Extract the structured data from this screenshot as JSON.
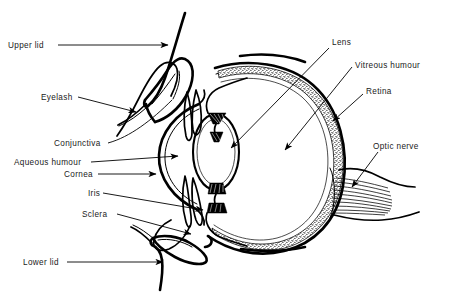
{
  "figure": {
    "background_color": "#ffffff",
    "ink_color": "#000000",
    "width": 451,
    "height": 302
  },
  "labels": {
    "upper_lid": "Upper lid",
    "eyelash": "Eyelash",
    "conjunctiva": "Conjunctiva",
    "aqueous_humour": "Aqueous humour",
    "cornea": "Cornea",
    "iris": "Iris",
    "sclera": "Sclera",
    "lower_lid": "Lower lid",
    "lens": "Lens",
    "vitreous_humour": "Vitreous humour",
    "retina": "Retina",
    "optic_nerve": "Optic nerve"
  },
  "parts": [
    {
      "id": "upper-lid",
      "label": "Upper lid",
      "side": "left",
      "label_x": 8,
      "label_y": 48,
      "leader_end_x": 168,
      "leader_end_y": 47
    },
    {
      "id": "eyelash",
      "label": "Eyelash",
      "side": "left",
      "label_x": 41,
      "label_y": 100,
      "leader_end_x": 135,
      "leader_end_y": 111
    },
    {
      "id": "conjunctiva",
      "label": "Conjunctiva",
      "side": "left",
      "label_x": 54,
      "label_y": 146,
      "leader_end_x": 172,
      "leader_end_y": 99
    },
    {
      "id": "aqueous-humour",
      "label": "Aqueous humour",
      "side": "left",
      "label_x": 14,
      "label_y": 165,
      "leader_end_x": 177,
      "leader_end_y": 157
    },
    {
      "id": "cornea",
      "label": "Cornea",
      "side": "left",
      "label_x": 64,
      "label_y": 177,
      "leader_end_x": 155,
      "leader_end_y": 175
    },
    {
      "id": "iris",
      "label": "Iris",
      "side": "left",
      "label_x": 88,
      "label_y": 196,
      "leader_end_x": 207,
      "leader_end_y": 211
    },
    {
      "id": "sclera",
      "label": "Sclera",
      "side": "left",
      "label_x": 82,
      "label_y": 217,
      "leader_end_x": 190,
      "leader_end_y": 233
    },
    {
      "id": "lower-lid",
      "label": "Lower lid",
      "side": "left",
      "label_x": 23,
      "label_y": 265,
      "leader_end_x": 162,
      "leader_end_y": 262
    },
    {
      "id": "lens",
      "label": "Lens",
      "side": "right",
      "label_x": 332,
      "label_y": 45,
      "leader_end_x": 230,
      "leader_end_y": 148
    },
    {
      "id": "vitreous-humour",
      "label": "Vitreous humour",
      "side": "right",
      "label_x": 355,
      "label_y": 64,
      "leader_end_x": 283,
      "leader_end_y": 150
    },
    {
      "id": "retina",
      "label": "Retina",
      "side": "right",
      "label_x": 366,
      "label_y": 92,
      "leader_end_x": 332,
      "leader_end_y": 122
    },
    {
      "id": "optic-nerve",
      "label": "Optic nerve",
      "side": "right",
      "label_x": 373,
      "label_y": 147,
      "leader_end_x": 351,
      "leader_end_y": 186
    }
  ],
  "structures": [
    {
      "id": "eyeball-sclera",
      "name": "sclera outer wall"
    },
    {
      "id": "retina-band",
      "name": "retina stippled band"
    },
    {
      "id": "lens-body",
      "name": "lens ellipse"
    },
    {
      "id": "ciliary-body",
      "name": "ciliary body hatching"
    },
    {
      "id": "cornea-arc",
      "name": "cornea"
    },
    {
      "id": "iris-flaps",
      "name": "iris"
    },
    {
      "id": "upper-eyelid",
      "name": "upper eyelid"
    },
    {
      "id": "lower-eyelid",
      "name": "lower eyelid"
    },
    {
      "id": "eyelash-upper",
      "name": "upper eyelash"
    },
    {
      "id": "eyelash-lower",
      "name": "lower eyelash"
    },
    {
      "id": "optic-nerve-fibres",
      "name": "optic nerve fibre bundle"
    },
    {
      "id": "conjunctiva-line",
      "name": "conjunctiva membrane"
    }
  ]
}
